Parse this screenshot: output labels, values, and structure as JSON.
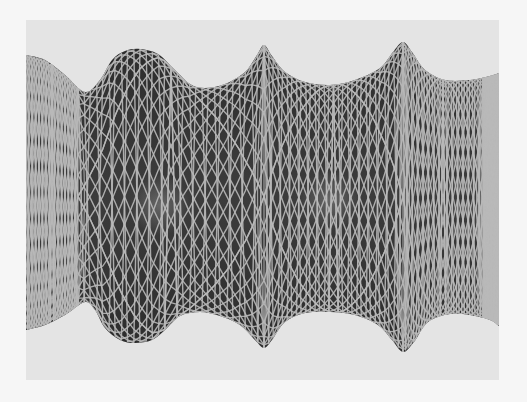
{
  "figure": {
    "kind": "rendered-3d-wireframe-surface",
    "colors": {
      "page_background": "#f6f6f6",
      "panel_background": "#e4e4e4",
      "surface_fill": "#3a3a3a",
      "surface_shadow": "#2a2a2a",
      "mesh_line": "#b9b9b9",
      "highlight": "#7a7a7a"
    },
    "panel": {
      "x": 26,
      "y": 20,
      "width": 473,
      "height": 360
    },
    "silhouette_top": [
      [
        26,
        55
      ],
      [
        45,
        60
      ],
      [
        65,
        75
      ],
      [
        85,
        92
      ],
      [
        100,
        80
      ],
      [
        112,
        60
      ],
      [
        125,
        51
      ],
      [
        140,
        49
      ],
      [
        158,
        54
      ],
      [
        175,
        70
      ],
      [
        190,
        84
      ],
      [
        205,
        88
      ],
      [
        225,
        84
      ],
      [
        245,
        72
      ],
      [
        257,
        55
      ],
      [
        264,
        45
      ],
      [
        272,
        56
      ],
      [
        285,
        72
      ],
      [
        305,
        82
      ],
      [
        330,
        85
      ],
      [
        355,
        80
      ],
      [
        380,
        68
      ],
      [
        393,
        52
      ],
      [
        403,
        42
      ],
      [
        412,
        52
      ],
      [
        425,
        70
      ],
      [
        445,
        80
      ],
      [
        470,
        80
      ],
      [
        490,
        76
      ],
      [
        499,
        73
      ]
    ],
    "silhouette_bottom": [
      [
        26,
        330
      ],
      [
        45,
        325
      ],
      [
        65,
        315
      ],
      [
        85,
        302
      ],
      [
        95,
        310
      ],
      [
        105,
        328
      ],
      [
        120,
        340
      ],
      [
        135,
        343
      ],
      [
        152,
        340
      ],
      [
        165,
        330
      ],
      [
        180,
        316
      ],
      [
        200,
        312
      ],
      [
        220,
        316
      ],
      [
        240,
        325
      ],
      [
        255,
        340
      ],
      [
        264,
        348
      ],
      [
        272,
        340
      ],
      [
        285,
        322
      ],
      [
        305,
        313
      ],
      [
        330,
        312
      ],
      [
        355,
        315
      ],
      [
        378,
        325
      ],
      [
        392,
        340
      ],
      [
        403,
        352
      ],
      [
        414,
        342
      ],
      [
        428,
        322
      ],
      [
        450,
        314
      ],
      [
        470,
        315
      ],
      [
        490,
        320
      ],
      [
        499,
        326
      ]
    ],
    "seams_x": [
      78,
      264,
      403,
      483
    ],
    "highlights": [
      {
        "cx": 40,
        "cy": 200,
        "rx": 22,
        "ry": 30
      },
      {
        "cx": 160,
        "cy": 205,
        "rx": 30,
        "ry": 30
      },
      {
        "cx": 330,
        "cy": 200,
        "rx": 30,
        "ry": 30
      },
      {
        "cx": 490,
        "cy": 215,
        "rx": 18,
        "ry": 30
      }
    ]
  }
}
